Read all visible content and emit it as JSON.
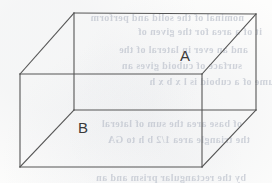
{
  "figure": {
    "type": "cuboid-oblique-projection",
    "caption_labels": [
      {
        "id": "A",
        "text": "A",
        "x": 187,
        "y": 56,
        "on_face": "top-face"
      },
      {
        "id": "B",
        "text": "B",
        "x": 85,
        "y": 128,
        "on_face": "front-face"
      }
    ],
    "stroke_color": "#555555",
    "stroke_width": 1.1,
    "background_color": "#fdfdfc",
    "vertices": {
      "front_top_left": {
        "x": 20,
        "y": 74
      },
      "front_top_right": {
        "x": 202,
        "y": 74
      },
      "front_bottom_left": {
        "x": 20,
        "y": 167
      },
      "front_bottom_right": {
        "x": 202,
        "y": 167
      },
      "back_top_left": {
        "x": 74,
        "y": 13
      },
      "back_top_right": {
        "x": 256,
        "y": 14
      },
      "back_bottom_left": {
        "x": 74,
        "y": 110
      },
      "back_bottom_right": {
        "x": 256,
        "y": 110
      }
    },
    "edges": [
      {
        "name": "front-top-edge",
        "from": "front_top_left",
        "to": "front_top_right"
      },
      {
        "name": "front-bottom-edge",
        "from": "front_bottom_left",
        "to": "front_bottom_right"
      },
      {
        "name": "front-left-edge",
        "from": "front_top_left",
        "to": "front_bottom_left"
      },
      {
        "name": "front-right-edge",
        "from": "front_top_right",
        "to": "front_bottom_right"
      },
      {
        "name": "back-top-edge",
        "from": "back_top_left",
        "to": "back_top_right"
      },
      {
        "name": "back-bottom-edge",
        "from": "back_bottom_left",
        "to": "back_bottom_right"
      },
      {
        "name": "back-left-edge",
        "from": "back_top_left",
        "to": "back_bottom_left"
      },
      {
        "name": "back-right-edge",
        "from": "back_top_right",
        "to": "back_bottom_right"
      },
      {
        "name": "connector-top-left",
        "from": "front_top_left",
        "to": "back_top_left"
      },
      {
        "name": "connector-top-right",
        "from": "front_top_right",
        "to": "back_top_right"
      },
      {
        "name": "connector-bottom-left",
        "from": "front_bottom_left",
        "to": "back_bottom_left"
      },
      {
        "name": "connector-bottom-right",
        "from": "front_bottom_right",
        "to": "back_bottom_right"
      }
    ]
  },
  "bleed_through": {
    "description": "faint mirrored text showing through from reverse side of scanned page",
    "color": "#a9b0be",
    "lines": [
      {
        "text": "nominal of the solid and perform",
        "x": 4,
        "y": 12,
        "size": 10
      },
      {
        "text": "it of a area for the given of",
        "x": 22,
        "y": 26,
        "size": 10
      },
      {
        "text": "and an ever in lateral of the",
        "x": 8,
        "y": 44,
        "size": 10
      },
      {
        "text": "surface of cuboid gives an",
        "x": 2,
        "y": 60,
        "size": 10
      },
      {
        "text": "volume of a cuboid is l x b x h",
        "x": 48,
        "y": 76,
        "size": 10
      },
      {
        "text": "of base area the sum of lateral",
        "x": 2,
        "y": 118,
        "size": 10
      },
      {
        "text": "the triangle area 1/2 b h  to GA",
        "x": 10,
        "y": 134,
        "size": 10
      },
      {
        "text": "by the rectangular prism and an",
        "x": 6,
        "y": 172,
        "size": 10
      }
    ]
  }
}
